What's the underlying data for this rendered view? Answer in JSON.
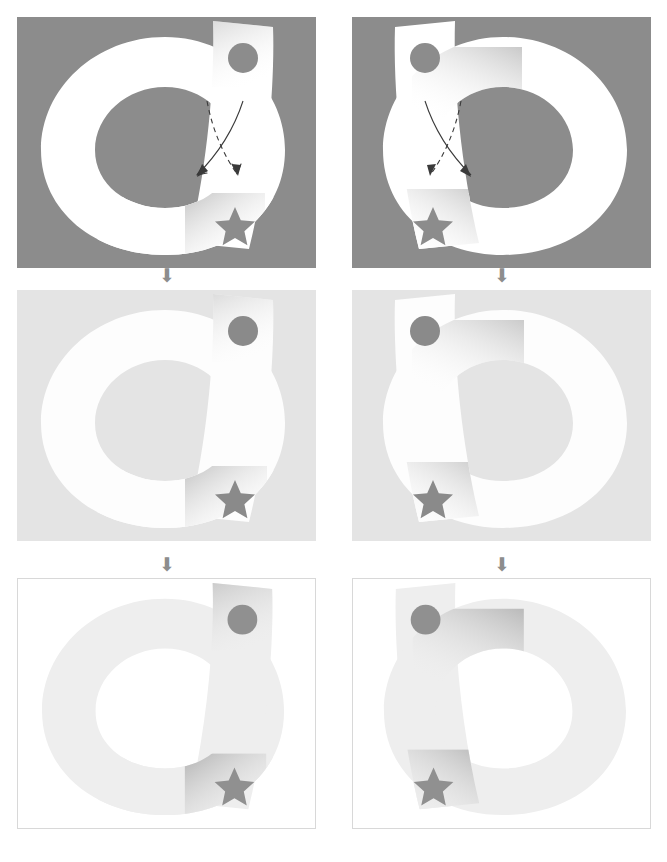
{
  "figure": {
    "columns": [
      "left",
      "right"
    ],
    "rows": 3,
    "panel_width": 299,
    "panel_height": 251
  },
  "colors": {
    "stage1_background": "#8c8c8c",
    "stage2_background": "#e4e4e4",
    "stage3_background": "#ffffff",
    "stage1_shape": "#ffffff",
    "stage2_shape": "#fdfdfd",
    "stage3_shape": "#eeeeee",
    "marker": "#8a8a8a",
    "stage3_marker": "#909090",
    "panel_border": "#d8d8d8",
    "arrow_glyph": "#8d8d8d",
    "annotation_stroke": "#3a3a3a",
    "shadow": "#c9c9c9"
  },
  "panels": [
    {
      "id": "panel-top-left",
      "row": 1,
      "column": "left",
      "stage": "high-contrast",
      "chirality": "left",
      "background": "#8c8c8c",
      "shape_fill": "#ffffff",
      "marker_fill": "#8c8c8c",
      "bordered": false,
      "annotations_visible": true,
      "markers": [
        {
          "name": "circle",
          "position": "band-top"
        },
        {
          "name": "star",
          "position": "band-bottom"
        }
      ]
    },
    {
      "id": "panel-top-right",
      "row": 1,
      "column": "right",
      "stage": "high-contrast",
      "chirality": "right",
      "background": "#8c8c8c",
      "shape_fill": "#ffffff",
      "marker_fill": "#8c8c8c",
      "bordered": false,
      "annotations_visible": true,
      "markers": [
        {
          "name": "circle",
          "position": "band-top"
        },
        {
          "name": "star",
          "position": "band-bottom"
        }
      ]
    },
    {
      "id": "panel-mid-left",
      "row": 2,
      "column": "left",
      "stage": "mid-contrast",
      "chirality": "left",
      "background": "#e4e4e4",
      "shape_fill": "#fdfdfd",
      "marker_fill": "#8a8a8a",
      "bordered": false,
      "annotations_visible": false,
      "markers": [
        {
          "name": "circle",
          "position": "band-top"
        },
        {
          "name": "star",
          "position": "band-bottom"
        }
      ]
    },
    {
      "id": "panel-mid-right",
      "row": 2,
      "column": "right",
      "stage": "mid-contrast",
      "chirality": "right",
      "background": "#e4e4e4",
      "shape_fill": "#fdfdfd",
      "marker_fill": "#8a8a8a",
      "bordered": false,
      "annotations_visible": false,
      "markers": [
        {
          "name": "circle",
          "position": "band-top"
        },
        {
          "name": "star",
          "position": "band-bottom"
        }
      ]
    },
    {
      "id": "panel-bottom-left",
      "row": 3,
      "column": "left",
      "stage": "low-contrast",
      "chirality": "left",
      "background": "#ffffff",
      "shape_fill": "#eeeeee",
      "marker_fill": "#909090",
      "bordered": true,
      "annotations_visible": false,
      "markers": [
        {
          "name": "circle",
          "position": "band-top"
        },
        {
          "name": "star",
          "position": "band-bottom"
        }
      ]
    },
    {
      "id": "panel-bottom-right",
      "row": 3,
      "column": "right",
      "stage": "low-contrast",
      "chirality": "right",
      "background": "#ffffff",
      "shape_fill": "#eeeeee",
      "marker_fill": "#909090",
      "bordered": true,
      "annotations_visible": false,
      "markers": [
        {
          "name": "circle",
          "position": "band-top"
        },
        {
          "name": "star",
          "position": "band-bottom"
        }
      ]
    }
  ],
  "flow_arrows": [
    {
      "id": "flow-left-1",
      "glyph": "⬇",
      "between": "row1-row2",
      "column": "left"
    },
    {
      "id": "flow-right-1",
      "glyph": "⬇",
      "between": "row1-row2",
      "column": "right"
    },
    {
      "id": "flow-left-2",
      "glyph": "⬇",
      "between": "row2-row3",
      "column": "left"
    },
    {
      "id": "flow-right-2",
      "glyph": "⬇",
      "between": "row2-row3",
      "column": "right"
    }
  ],
  "annotations": {
    "solid_arrow": {
      "style": "solid",
      "head": "arrowhead",
      "direction": "down"
    },
    "dashed_arrow": {
      "style": "dashed",
      "head": "arrowhead",
      "direction": "down"
    },
    "relationship": "crossing"
  }
}
